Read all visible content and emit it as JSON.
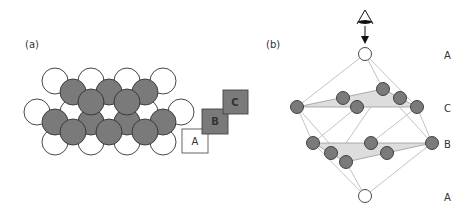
{
  "panel_a": {
    "label": "(a)",
    "squares": [
      {
        "letter": "A",
        "fill": "#ffffff"
      },
      {
        "letter": "B",
        "fill": "#7a7a7a"
      },
      {
        "letter": "C",
        "fill": "#7a7a7a"
      }
    ]
  },
  "panel_b": {
    "label": "(b)",
    "layer_labels": [
      "A",
      "C",
      "B",
      "A"
    ],
    "viewer_icon": "eye-icon"
  },
  "colors": {
    "atom_gray": "#7a7a7a",
    "atom_white": "#ffffff",
    "outline": "#333333",
    "plane_fill": "#dddddd",
    "edge_line": "#bbbbbb"
  }
}
